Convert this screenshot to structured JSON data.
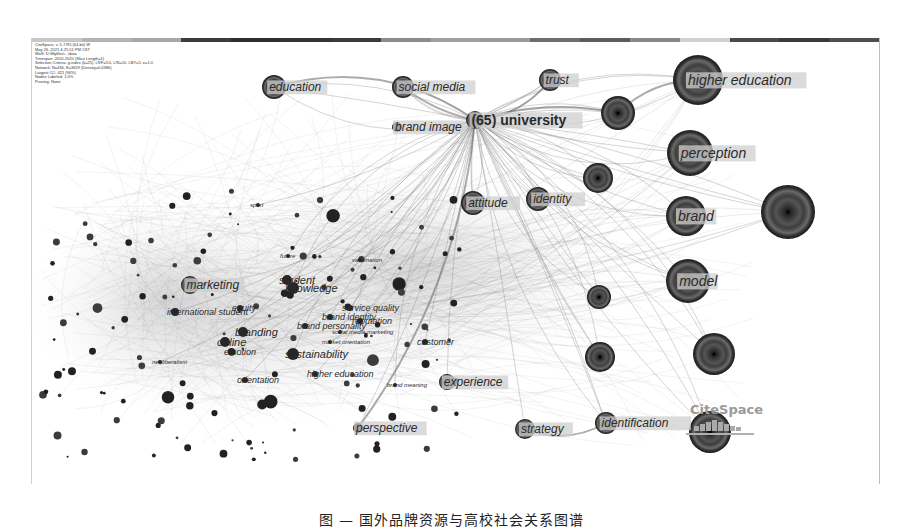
{
  "figure": {
    "software": "CiteSpace",
    "info_lines": [
      "CiteSpace, v. 5.7.R5 (64-bit) W",
      "May 26, 2021 4:25:51 PM CST",
      "WoS: D:\\Myfiles\\...\\data",
      "Timespan: 2010-2020 (Slice Length=1)",
      "Selection Criteria: g-index (k=25), LRF=3.0, L/N=10, LBY=5, e=1.0",
      "Network: N=436, E=3659 (Density=0.0386)",
      "Largest CC: 421 (96%)",
      "Nodes Labeled: 1.0%",
      "Pruning: None"
    ],
    "timeline_colors": [
      "#c8c8c8",
      "#b4b4b4",
      "#a8a8a8",
      "#3c3c3c",
      "#2e2e2e",
      "#343434",
      "#3a3a3a",
      "#8c8c8c",
      "#a0a0a0",
      "#9a9a9a",
      "#6e6e6e",
      "#5c5c5c",
      "#888888",
      "#d2d2d2",
      "#4a4a4a",
      "#3a3a3a",
      "#4e4e4e"
    ],
    "caption": "图 — 国外品牌资源与高校社会关系图谱"
  },
  "chart_data": {
    "type": "network",
    "hub": {
      "label": "(65) university",
      "frequency": 65
    },
    "nodes": [
      {
        "id": "university",
        "label": "(65) university",
        "x": 475,
        "y": 120,
        "r": 9,
        "bold": true
      },
      {
        "id": "higher-education",
        "label": "higher education",
        "x": 698,
        "y": 80,
        "r": 25
      },
      {
        "id": "perception",
        "label": "perception",
        "x": 690,
        "y": 153,
        "r": 23
      },
      {
        "id": "brand",
        "label": "brand",
        "x": 686,
        "y": 216,
        "r": 20
      },
      {
        "id": "model",
        "label": "model",
        "x": 688,
        "y": 281,
        "r": 22
      },
      {
        "id": "unlabeled-right-1",
        "label": "",
        "x": 788,
        "y": 212,
        "r": 27
      },
      {
        "id": "unlabeled-right-2",
        "label": "",
        "x": 714,
        "y": 354,
        "r": 21
      },
      {
        "id": "unlabeled-right-3",
        "label": "",
        "x": 710,
        "y": 432,
        "r": 21
      },
      {
        "id": "unlabeled-right-4",
        "label": "",
        "x": 618,
        "y": 113,
        "r": 17
      },
      {
        "id": "unlabeled-right-5",
        "label": "",
        "x": 598,
        "y": 178,
        "r": 15
      },
      {
        "id": "unlabeled-right-6",
        "label": "",
        "x": 599,
        "y": 297,
        "r": 12
      },
      {
        "id": "unlabeled-right-7",
        "label": "",
        "x": 600,
        "y": 357,
        "r": 15
      },
      {
        "id": "education",
        "label": "education",
        "x": 274,
        "y": 87,
        "r": 12
      },
      {
        "id": "social-media",
        "label": "social media",
        "x": 403,
        "y": 87,
        "r": 11
      },
      {
        "id": "trust",
        "label": "trust",
        "x": 550,
        "y": 80,
        "r": 11
      },
      {
        "id": "brand-image",
        "label": "brand image",
        "x": 397,
        "y": 127,
        "r": 5
      },
      {
        "id": "attitude",
        "label": "attitude",
        "x": 473,
        "y": 203,
        "r": 12
      },
      {
        "id": "identity",
        "label": "identity",
        "x": 538,
        "y": 199,
        "r": 12
      },
      {
        "id": "experience",
        "label": "experience",
        "x": 447,
        "y": 382,
        "r": 8
      },
      {
        "id": "strategy",
        "label": "strategy",
        "x": 525,
        "y": 429,
        "r": 10
      },
      {
        "id": "identification",
        "label": "identification",
        "x": 606,
        "y": 423,
        "r": 11
      },
      {
        "id": "perspective",
        "label": "perspective",
        "x": 358,
        "y": 428,
        "r": 5
      },
      {
        "id": "marketing",
        "label": "marketing",
        "x": 190,
        "y": 285,
        "r": 9
      },
      {
        "id": "knowledge",
        "label": "knowledge",
        "x": 293,
        "y": 288,
        "r": 6
      },
      {
        "id": "student",
        "label": "student",
        "x": 287,
        "y": 280,
        "r": 5
      },
      {
        "id": "sustainability",
        "label": "sustainability",
        "x": 293,
        "y": 354,
        "r": 6
      },
      {
        "id": "online",
        "label": "online",
        "x": 225,
        "y": 342,
        "r": 5
      },
      {
        "id": "branding",
        "label": "branding",
        "x": 243,
        "y": 332,
        "r": 5
      },
      {
        "id": "international-student",
        "label": "international student",
        "x": 175,
        "y": 312,
        "r": 4
      },
      {
        "id": "equity",
        "label": "equity",
        "x": 240,
        "y": 308,
        "r": 3
      },
      {
        "id": "brand-personality",
        "label": "brand personality",
        "x": 305,
        "y": 326,
        "r": 3
      },
      {
        "id": "brand-identity",
        "label": "brand identity",
        "x": 330,
        "y": 317,
        "r": 3
      },
      {
        "id": "reputation",
        "label": "reputation",
        "x": 360,
        "y": 321,
        "r": 3
      },
      {
        "id": "service-quality",
        "label": "service quality",
        "x": 350,
        "y": 308,
        "r": 3
      },
      {
        "id": "customer",
        "label": "customer",
        "x": 425,
        "y": 342,
        "r": 3
      },
      {
        "id": "higher-education-2",
        "label": "higher education",
        "x": 315,
        "y": 374,
        "r": 3
      },
      {
        "id": "orientation",
        "label": "orientation",
        "x": 245,
        "y": 380,
        "r": 3
      },
      {
        "id": "emotion",
        "label": "emotion",
        "x": 232,
        "y": 352,
        "r": 3
      },
      {
        "id": "market-orientation",
        "label": "market orientation",
        "x": 330,
        "y": 342,
        "r": 2
      },
      {
        "id": "social-media-marketing",
        "label": "social media marketing",
        "x": 340,
        "y": 332,
        "r": 2
      },
      {
        "id": "neoliberalism",
        "label": "neoliberalism",
        "x": 160,
        "y": 362,
        "r": 2
      },
      {
        "id": "brand-meaning",
        "label": "brand meaning",
        "x": 395,
        "y": 385,
        "r": 2
      },
      {
        "id": "sport",
        "label": "sport",
        "x": 258,
        "y": 205,
        "r": 2
      },
      {
        "id": "future",
        "label": "future",
        "x": 288,
        "y": 256,
        "r": 2
      },
      {
        "id": "vaccination",
        "label": "vaccination",
        "x": 360,
        "y": 260,
        "r": 2
      }
    ],
    "node_color_scheme": "grayscale concentric citation rings",
    "edge_style": "curved gray links, dense fan from hub 'university'"
  }
}
